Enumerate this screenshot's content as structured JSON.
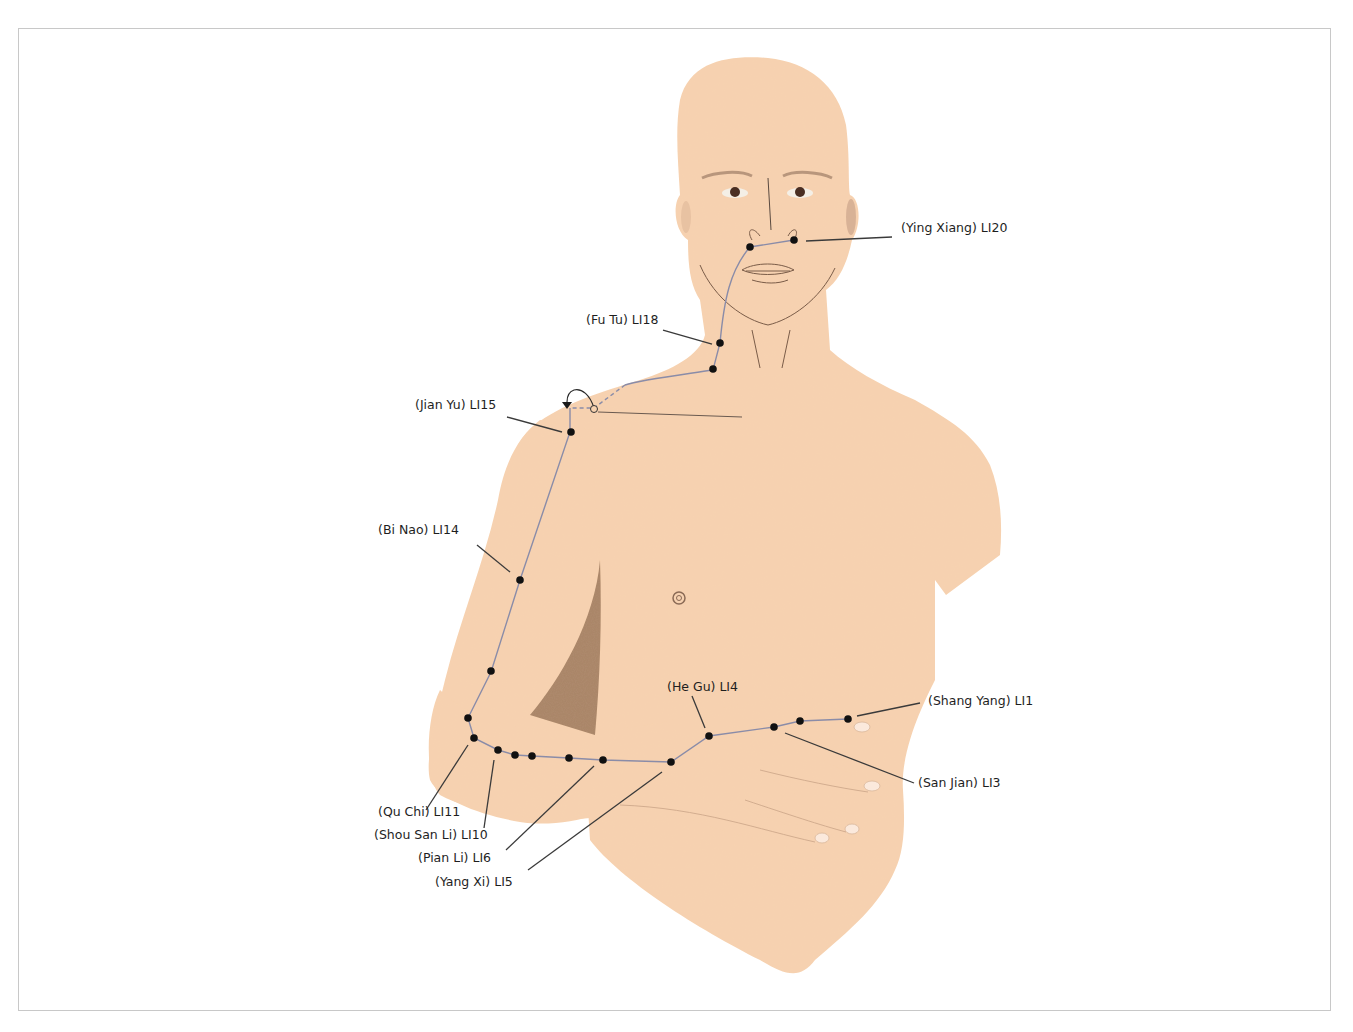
{
  "diagram": {
    "colors": {
      "skin": "#f7d2b0",
      "skin_shadow": "#a88466",
      "meridian_line": "#8a8ca8",
      "point": "#111111",
      "leader_line": "#3a3a3a",
      "label_text": "#1e1e1e",
      "frame_border": "#c8c8c8"
    },
    "points": [
      {
        "id": "LI20",
        "label": "(Ying Xiang) LI20"
      },
      {
        "id": "LI18",
        "label": "(Fu Tu) LI18"
      },
      {
        "id": "LI15",
        "label": "(Jian Yu) LI15"
      },
      {
        "id": "LI14",
        "label": "(Bi Nao) LI14"
      },
      {
        "id": "LI11",
        "label": "(Qu Chi) LI11"
      },
      {
        "id": "LI10",
        "label": "(Shou San Li) LI10"
      },
      {
        "id": "LI6",
        "label": "(Pian Li) LI6"
      },
      {
        "id": "LI5",
        "label": "(Yang Xi) LI5"
      },
      {
        "id": "LI4",
        "label": "(He Gu) LI4"
      },
      {
        "id": "LI3",
        "label": "(San Jian) LI3"
      },
      {
        "id": "LI1",
        "label": "(Shang Yang) LI1"
      }
    ]
  }
}
